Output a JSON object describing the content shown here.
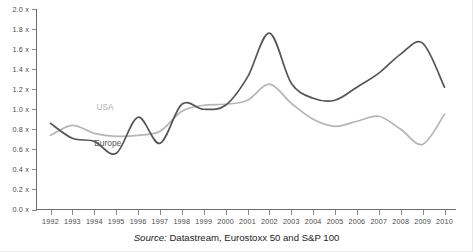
{
  "caption": {
    "source_word": "Source:",
    "source_text": " Datastream, Eurostoxx 50 and S&P 100"
  },
  "labels": {
    "europe": "Europe",
    "usa": "USA"
  },
  "colors": {
    "europe_line": "#555555",
    "usa_line": "#b5b5b5",
    "axis": "#6d6d6d",
    "tick": "#8a8a8a",
    "tick_text": "#4a4a4a",
    "background": "#ffffff",
    "caption_text": "#1d1d1d"
  },
  "chart_data": {
    "type": "line",
    "title": "",
    "subtitle": "",
    "xlabel": "",
    "ylabel": "",
    "grid": false,
    "legend_position": "inline-annotation",
    "ylim": [
      0.0,
      2.0
    ],
    "xlim": [
      1992,
      2010
    ],
    "ytick_labels": [
      "2.0 x",
      "1.8 x",
      "1.6 x",
      "1.4 x",
      "1.2 x",
      "1.0 x",
      "0.8 x",
      "0.6 x",
      "0.4 x",
      "0.2 x",
      "0.0 x"
    ],
    "ytick_values": [
      2.0,
      1.8,
      1.6,
      1.4,
      1.2,
      1.0,
      0.8,
      0.6,
      0.4,
      0.2,
      0.0
    ],
    "categories": [
      "1992",
      "1993",
      "1994",
      "1995",
      "1996",
      "1997",
      "1998",
      "1999",
      "2000",
      "2001",
      "2002",
      "2003",
      "2004",
      "2005",
      "2006",
      "2007",
      "2008",
      "2009",
      "2010"
    ],
    "x": [
      1992,
      1993,
      1994,
      1995,
      1996,
      1997,
      1998,
      1999,
      2000,
      2001,
      2002,
      2003,
      2004,
      2005,
      2006,
      2007,
      2008,
      2009,
      2010
    ],
    "series": [
      {
        "name": "Europe",
        "color": "#555555",
        "values": [
          0.86,
          0.71,
          0.68,
          0.56,
          0.92,
          0.66,
          1.05,
          1.0,
          1.04,
          1.32,
          1.76,
          1.26,
          1.11,
          1.09,
          1.22,
          1.36,
          1.55,
          1.66,
          1.22
        ]
      },
      {
        "name": "USA",
        "color": "#b5b5b5",
        "values": [
          0.74,
          0.84,
          0.76,
          0.73,
          0.74,
          0.78,
          0.98,
          1.04,
          1.05,
          1.09,
          1.25,
          1.06,
          0.9,
          0.83,
          0.88,
          0.93,
          0.8,
          0.65,
          0.95
        ]
      }
    ],
    "annotations": [
      {
        "text": "USA",
        "x": 1994.1,
        "y": 0.99,
        "color": "#b5b5b5"
      },
      {
        "text": "Europe",
        "x": 1994.0,
        "y": 0.63,
        "color": "#585858"
      }
    ]
  }
}
